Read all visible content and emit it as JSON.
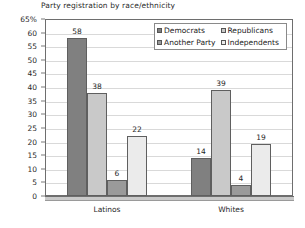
{
  "chart_data": {
    "type": "bar",
    "title": "Party registration by race/ethnicity",
    "xlabel": "",
    "ylabel": "",
    "categories": [
      "Latinos",
      "Whites"
    ],
    "series": [
      {
        "name": "Democrats",
        "values": [
          58,
          14
        ],
        "color": "#808080"
      },
      {
        "name": "Republicans",
        "values": [
          38,
          39
        ],
        "color": "#c9c9c9"
      },
      {
        "name": "Another Party",
        "values": [
          6,
          4
        ],
        "color": "#9a9a9a"
      },
      {
        "name": "Independents",
        "values": [
          22,
          19
        ],
        "color": "#ebebeb"
      }
    ],
    "grouped_values": {
      "Latinos": {
        "Democrats": 58,
        "Republicans": 14,
        "Another Party": 6,
        "Independents": 22
      },
      "Whites": {
        "Democrats": 38,
        "Republicans": 39,
        "Another Party": 4,
        "Independents": 19
      }
    },
    "ylim": [
      0,
      65
    ],
    "ytick_step": 5,
    "ytick_labels": [
      "65%",
      "60",
      "55",
      "50",
      "45",
      "40",
      "35",
      "30",
      "25",
      "20",
      "15",
      "10",
      "5",
      "0"
    ],
    "ytick_values": [
      65,
      60,
      55,
      50,
      45,
      40,
      35,
      30,
      25,
      20,
      15,
      10,
      5,
      0
    ],
    "grid": "horizontal",
    "legend_position": "inside-top-right",
    "data_labels_shown": true
  },
  "legend": {
    "items": [
      {
        "label": "Democrats",
        "color": "#808080"
      },
      {
        "label": "Republicans",
        "color": "#c9c9c9"
      },
      {
        "label": "Another Party",
        "color": "#9a9a9a"
      },
      {
        "label": "Independents",
        "color": "#ebebeb"
      }
    ]
  }
}
